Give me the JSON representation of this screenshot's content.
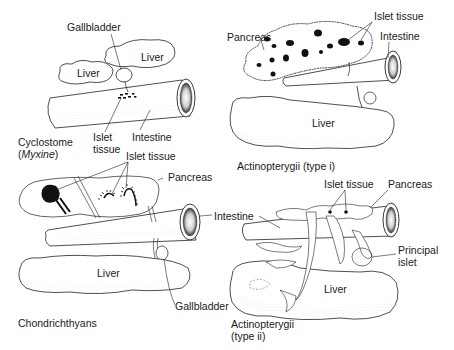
{
  "figure": {
    "panels": [
      {
        "id": "cyclostome",
        "caption_line1": "Cyclostome",
        "caption_line2_prefix": "(",
        "caption_line2_italic": "Myxine",
        "caption_line2_suffix": ")",
        "labels": {
          "gallbladder": "Gallbladder",
          "liver_left": "Liver",
          "liver_right": "Liver",
          "islet_line1": "Islet",
          "islet_line2": "tissue",
          "intestine": "Intestine"
        }
      },
      {
        "id": "actinopterygii-type-i",
        "caption": "Actinopterygii (type i)",
        "labels": {
          "pancreas": "Pancreas",
          "islet_tissue": "Islet tissue",
          "intestine": "Intestine",
          "liver": "Liver"
        }
      },
      {
        "id": "chondrichthyans",
        "caption": "Chondrichthyans",
        "labels": {
          "islet_tissue": "Islet tissue",
          "pancreas": "Pancreas",
          "intestine": "Intestine",
          "liver": "Liver",
          "gallbladder": "Gallbladder"
        }
      },
      {
        "id": "actinopterygii-type-ii",
        "caption_line1": "Actinopterygii",
        "caption_line2": "(type ii)",
        "labels": {
          "islet_tissue": "Islet tissue",
          "pancreas": "Pancreas",
          "intestine": "Intestine",
          "principal_line1": "Principal",
          "principal_line2": "islet",
          "liver": "Liver"
        }
      }
    ]
  }
}
